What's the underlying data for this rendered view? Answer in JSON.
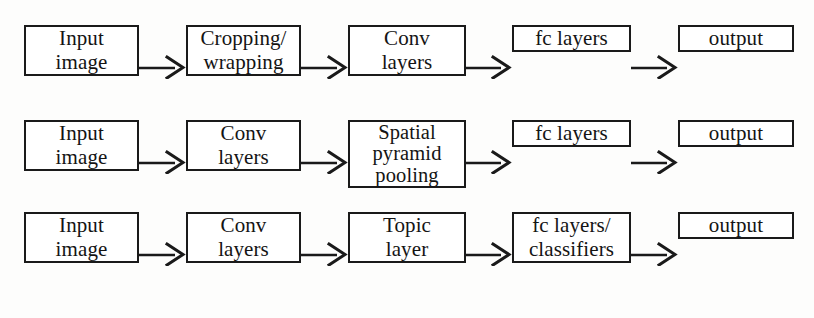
{
  "figure": {
    "background_color": "#fdfdfc",
    "stroke_color": "#1a1a1a",
    "box_fill": "#ffffff",
    "arrow_glyph": "arrow-right"
  },
  "rows": [
    {
      "id": "row-cropping-wrapping",
      "nodes": [
        {
          "id": "input-image",
          "lines": [
            "Input",
            "image"
          ]
        },
        {
          "id": "cropping-wrapping",
          "lines": [
            "Cropping/",
            "wrapping"
          ]
        },
        {
          "id": "conv-layers",
          "lines": [
            "Conv",
            "layers"
          ]
        },
        {
          "id": "fc-layers",
          "lines": [
            "fc layers"
          ]
        },
        {
          "id": "output",
          "lines": [
            "output"
          ]
        }
      ]
    },
    {
      "id": "row-spatial-pyramid-pooling",
      "nodes": [
        {
          "id": "input-image",
          "lines": [
            "Input",
            "image"
          ]
        },
        {
          "id": "conv-layers",
          "lines": [
            "Conv",
            "layers"
          ]
        },
        {
          "id": "spatial-pyramid-pooling",
          "lines": [
            "Spatial",
            "pyramid",
            "pooling"
          ]
        },
        {
          "id": "fc-layers",
          "lines": [
            "fc layers"
          ]
        },
        {
          "id": "output",
          "lines": [
            "output"
          ]
        }
      ]
    },
    {
      "id": "row-topic-layer",
      "nodes": [
        {
          "id": "input-image",
          "lines": [
            "Input",
            "image"
          ]
        },
        {
          "id": "conv-layers",
          "lines": [
            "Conv",
            "layers"
          ]
        },
        {
          "id": "topic-layer",
          "lines": [
            "Topic",
            "layer"
          ]
        },
        {
          "id": "fc-layers-classifiers",
          "lines": [
            "fc layers/",
            "classifiers"
          ]
        },
        {
          "id": "output",
          "lines": [
            "output"
          ]
        }
      ]
    }
  ]
}
